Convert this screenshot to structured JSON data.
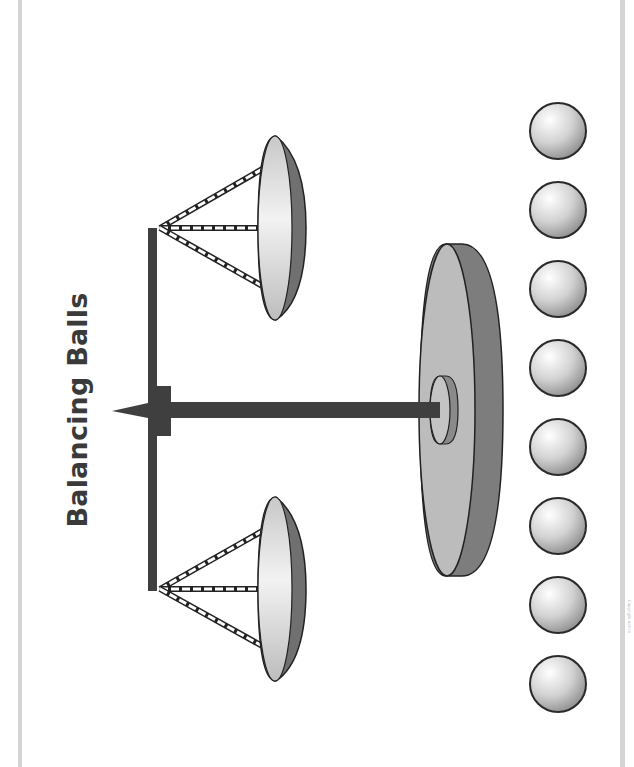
{
  "title": "Balancing Balls",
  "footer": "Copyright notice",
  "colors": {
    "frame": "#d4d4d4",
    "beam": "#3f3f3f",
    "pan_rim": "#6e6e6e",
    "pan_face": "#dcdcdc",
    "base_face": "#bdbdbd",
    "base_edge": "#7a7a7a",
    "ball": "#d0d0d0"
  },
  "diagram": {
    "scale": {
      "pans": [
        "upper-pan",
        "lower-pan"
      ],
      "pointer": "pointer"
    },
    "balls": [
      {
        "id": 1
      },
      {
        "id": 2
      },
      {
        "id": 3
      },
      {
        "id": 4
      },
      {
        "id": 5
      },
      {
        "id": 6
      },
      {
        "id": 7
      },
      {
        "id": 8
      }
    ]
  }
}
